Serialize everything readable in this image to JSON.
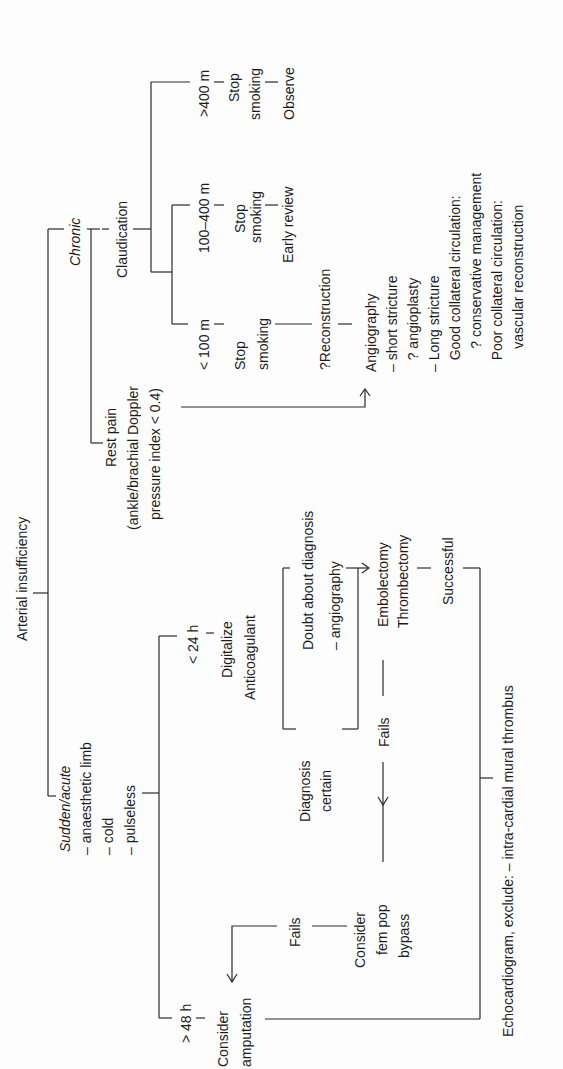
{
  "diagram": {
    "title": "Arterial insufficiency",
    "orientation": "rotated-90-ccw",
    "chronic": {
      "label": "Chronic",
      "claudication": {
        "label": "Claudication",
        "branches": [
          {
            "distance": "< 100 m",
            "step1a": "Stop",
            "step1b": "smoking",
            "step2": "?Reconstruction"
          },
          {
            "distance": "100–400 m",
            "step1a": "Stop",
            "step1b": "smoking",
            "step2": "Early review"
          },
          {
            "distance": ">400 m",
            "step1a": "Stop",
            "step1b": "smoking",
            "step2": "Observe"
          }
        ]
      },
      "rest_pain": {
        "line1": "Rest pain",
        "line2": "(ankle/brachial Doppler",
        "line3": "pressure index < 0.4)"
      },
      "angiography": {
        "title": "Angiography",
        "lines": [
          "– short stricture",
          "   ? angioplasty",
          "– Long stricture",
          "   Good collateral circulation:",
          "      ? conservative management",
          "   Poor collateral circulation:",
          "      vascular reconstruction"
        ]
      }
    },
    "acute": {
      "label": "Sudden/acute",
      "symptoms": [
        "– anaesthetic limb",
        "– cold",
        "– pulseless"
      ],
      "lt24h": {
        "label": "< 24 h",
        "actions": [
          "Digitalize",
          "Anticoagulant"
        ],
        "doubt": [
          "Doubt about diagnosis",
          "– angiography"
        ],
        "certain": [
          "Diagnosis",
          "certain"
        ],
        "embolectomy": [
          "Embolectomy",
          "Thrombectomy"
        ],
        "successful": "Successful",
        "fails1": "Fails",
        "fempop": [
          "Consider",
          "fem pop",
          "bypass"
        ],
        "fails2": "Fails"
      },
      "gt48h": {
        "label": "> 48 h",
        "action": [
          "Consider",
          "amputation"
        ]
      },
      "echo": "Echocardiogram, exclude: – intra-cardial mural thrombus"
    }
  }
}
